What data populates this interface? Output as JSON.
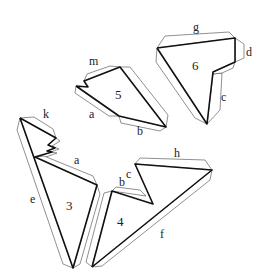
{
  "figure": {
    "pieces": [
      {
        "id": "3",
        "label": "3",
        "edge_labels": [
          "k",
          "a",
          "e"
        ]
      },
      {
        "id": "4",
        "label": "4",
        "edge_labels": [
          "b",
          "c",
          "h",
          "f"
        ]
      },
      {
        "id": "5",
        "label": "5",
        "edge_labels": [
          "m",
          "a",
          "b"
        ]
      },
      {
        "id": "6",
        "label": "6",
        "edge_labels": [
          "g",
          "d",
          "c"
        ]
      }
    ]
  },
  "labels": {
    "p6": {
      "num": "6",
      "g": "g",
      "d": "d",
      "c": "c"
    },
    "p5": {
      "num": "5",
      "m": "m",
      "a": "a",
      "b": "b"
    },
    "p3": {
      "num": "3",
      "k": "k",
      "a": "a",
      "e": "e"
    },
    "p4": {
      "num": "4",
      "b": "b",
      "c": "c",
      "h": "h",
      "f": "f"
    }
  }
}
